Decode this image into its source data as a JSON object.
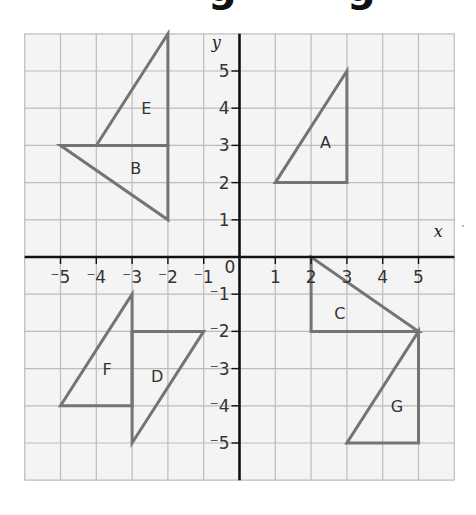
{
  "title": {
    "text": "Reflections to rotations grid image",
    "visible_fragment": "g g"
  },
  "grid": {
    "x_min": -6,
    "x_max": 6,
    "y_min": -6,
    "y_max": 6,
    "background": "#f4f4f4",
    "line_color": "#bcbcbc",
    "axis_color": "#111111",
    "shape_color": "#747474"
  },
  "axes": {
    "x_label": "x",
    "y_label": "y",
    "origin_label": "0",
    "x_ticks": [
      {
        "value": -5,
        "label": "⁻5"
      },
      {
        "value": -4,
        "label": "⁻4"
      },
      {
        "value": -3,
        "label": "⁻3"
      },
      {
        "value": -2,
        "label": "⁻2"
      },
      {
        "value": -1,
        "label": "⁻1"
      },
      {
        "value": 1,
        "label": "1"
      },
      {
        "value": 2,
        "label": "2"
      },
      {
        "value": 3,
        "label": "3"
      },
      {
        "value": 4,
        "label": "4"
      },
      {
        "value": 5,
        "label": "5"
      }
    ],
    "y_ticks": [
      {
        "value": 5,
        "label": "5"
      },
      {
        "value": 4,
        "label": "4"
      },
      {
        "value": 3,
        "label": "3"
      },
      {
        "value": 2,
        "label": "2"
      },
      {
        "value": 1,
        "label": "1"
      },
      {
        "value": -1,
        "label": "⁻1"
      },
      {
        "value": -2,
        "label": "⁻2"
      },
      {
        "value": -3,
        "label": "⁻3"
      },
      {
        "value": -4,
        "label": "⁻4"
      },
      {
        "value": -5,
        "label": "⁻5"
      }
    ]
  },
  "shapes": [
    {
      "label": "A",
      "vertices": [
        [
          1,
          2
        ],
        [
          3,
          2
        ],
        [
          3,
          5
        ]
      ],
      "label_pos": [
        2.4,
        3.1
      ]
    },
    {
      "label": "B",
      "vertices": [
        [
          -5,
          3
        ],
        [
          -2,
          3
        ],
        [
          -2,
          1
        ]
      ],
      "label_pos": [
        -2.9,
        2.4
      ]
    },
    {
      "label": "C",
      "vertices": [
        [
          2,
          0
        ],
        [
          2,
          -2
        ],
        [
          5,
          -2
        ]
      ],
      "label_pos": [
        2.8,
        -1.5
      ]
    },
    {
      "label": "D",
      "vertices": [
        [
          -3,
          -2
        ],
        [
          -1,
          -2
        ],
        [
          -3,
          -5
        ]
      ],
      "label_pos": [
        -2.3,
        -3.2
      ]
    },
    {
      "label": "E",
      "vertices": [
        [
          -4,
          3
        ],
        [
          -2,
          3
        ],
        [
          -2,
          6
        ]
      ],
      "label_pos": [
        -2.6,
        4.0
      ]
    },
    {
      "label": "F",
      "vertices": [
        [
          -5,
          -4
        ],
        [
          -3,
          -4
        ],
        [
          -3,
          -1
        ]
      ],
      "label_pos": [
        -3.7,
        -3.0
      ]
    },
    {
      "label": "G",
      "vertices": [
        [
          5,
          -2
        ],
        [
          5,
          -5
        ],
        [
          3,
          -5
        ]
      ],
      "label_pos": [
        4.4,
        -4.0
      ]
    }
  ]
}
